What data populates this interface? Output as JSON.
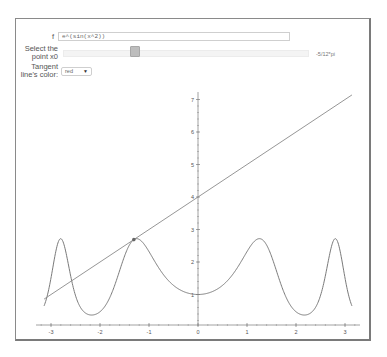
{
  "controls": {
    "function_label": "f",
    "function_value": "e^(sin(x^2))",
    "point_label_line1": "Select the",
    "point_label_line2": "point x0",
    "point_value": "-5/12*pi",
    "slider_position_pct": 28,
    "color_label_line1": "Tangent",
    "color_label_line2": "line's color:",
    "color_selected": "red",
    "color_arrow": "▼"
  },
  "plot": {
    "x_ticks": [
      "-3",
      "-2",
      "-1",
      "0",
      "1",
      "2",
      "3"
    ],
    "y_ticks": [
      "1",
      "2",
      "3",
      "4",
      "5",
      "6",
      "7"
    ],
    "curve_color": "#7a7a7a",
    "tangent_color": "#8a8a8a"
  },
  "chart_data": {
    "type": "line",
    "title": "",
    "xlabel": "",
    "ylabel": "",
    "xlim": [
      -3.14159,
      3.14159
    ],
    "ylim": [
      0,
      7.2
    ],
    "grid": false,
    "series": [
      {
        "name": "f(x) = e^(sin(x^2))",
        "function": "exp(sin(x^2))"
      },
      {
        "name": "tangent at x0",
        "x0": -1.309,
        "y0": 2.69,
        "slope": 1.0,
        "intercept": 4.0
      }
    ],
    "point": {
      "x": -1.309,
      "y": 2.69,
      "label": "x0 = -5/12*pi"
    }
  }
}
